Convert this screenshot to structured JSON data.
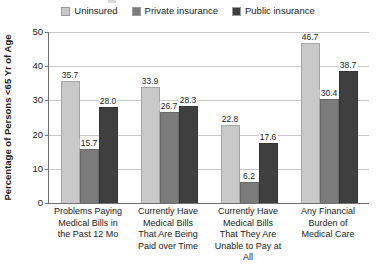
{
  "legend": {
    "items": [
      {
        "label": "Uninsured",
        "color": "#c9c9c9",
        "icon": "legend-swatch-icon"
      },
      {
        "label": "Private insurance",
        "color": "#7b7b7b",
        "icon": "legend-swatch-icon"
      },
      {
        "label": "Public insurance",
        "color": "#3f3f3f",
        "icon": "legend-swatch-icon"
      }
    ]
  },
  "axes": {
    "y_title": "Percentage of Persons <65 Yr of Age",
    "y_ticks": [
      "50",
      "40",
      "30",
      "20",
      "10",
      "0"
    ]
  },
  "chart_data": {
    "type": "bar",
    "title": "",
    "subtitle": "",
    "xlabel": "",
    "ylabel": "Percentage of Persons <65 Yr of Age",
    "ylim": [
      0,
      50
    ],
    "yticks": [
      0,
      10,
      20,
      30,
      40,
      50
    ],
    "grid": true,
    "legend_position": "top-center",
    "grouping": "grouped",
    "categories": [
      "Problems Paying Medical Bills in the Past 12 Mo",
      "Currently Have Medical Bills That Are Being Paid over Time",
      "Currently Have Medical Bills That They Are Unable to Pay at All",
      "Any Financial Burden of Medical Care"
    ],
    "category_lines": [
      [
        "Problems Paying",
        "Medical Bills in",
        "the Past 12 Mo"
      ],
      [
        "Currently Have",
        "Medical Bills",
        "That Are Being",
        "Paid over Time"
      ],
      [
        "Currently Have",
        "Medical Bills",
        "That They Are",
        "Unable to Pay at All"
      ],
      [
        "Any Financial",
        "Burden of",
        "Medical Care"
      ]
    ],
    "series": [
      {
        "name": "Uninsured",
        "color": "#c9c9c9",
        "values": [
          35.7,
          33.9,
          22.8,
          46.7
        ],
        "labels": [
          "35.7",
          "33.9",
          "22.8",
          "46.7"
        ]
      },
      {
        "name": "Private insurance",
        "color": "#7b7b7b",
        "values": [
          15.7,
          26.7,
          6.2,
          30.4
        ],
        "labels": [
          "15.7",
          "26.7",
          "6.2",
          "30.4"
        ]
      },
      {
        "name": "Public insurance",
        "color": "#3f3f3f",
        "values": [
          28.0,
          28.3,
          17.6,
          38.7
        ],
        "labels": [
          "28.0",
          "28.3",
          "17.6",
          "38.7"
        ]
      }
    ]
  }
}
